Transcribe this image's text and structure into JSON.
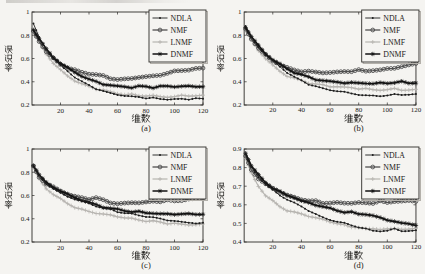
{
  "page": {
    "background": "#f5f4f1"
  },
  "figure": {
    "xlabel": "维数",
    "ylabel": "误识率",
    "legend_labels": [
      "NDLA",
      "NMF",
      "LNMF",
      "DNMF"
    ],
    "styles": {
      "NDLA": {
        "color": "#1c1c1c",
        "marker": "dot",
        "width": 0.9
      },
      "NMF": {
        "color": "#4f4f4f",
        "marker": "circle",
        "width": 1.3
      },
      "LNMF": {
        "color": "#b6b4b0",
        "marker": "plus",
        "width": 1.2
      },
      "DNMF": {
        "color": "#121212",
        "marker": "star",
        "width": 1.5
      }
    },
    "axis_color": "#2e2c29",
    "text_color": "#1c1a18"
  },
  "chart_data": [
    {
      "type": "line",
      "label": "(a)",
      "xlabel": "维数",
      "ylabel": "误识率",
      "xlim": [
        0,
        120
      ],
      "ylim": [
        0.2,
        1.0
      ],
      "xticks": [
        20,
        40,
        60,
        80,
        100,
        120
      ],
      "yticks": [
        0.2,
        0.4,
        0.6,
        0.8,
        1
      ],
      "x": [
        1,
        5,
        10,
        15,
        20,
        25,
        30,
        35,
        40,
        45,
        50,
        55,
        60,
        65,
        70,
        75,
        80,
        85,
        90,
        95,
        100,
        105,
        110,
        115,
        120
      ],
      "series": [
        {
          "name": "NDLA",
          "values": [
            0.9,
            0.78,
            0.68,
            0.6,
            0.54,
            0.49,
            0.44,
            0.4,
            0.37,
            0.34,
            0.32,
            0.3,
            0.29,
            0.28,
            0.27,
            0.27,
            0.26,
            0.26,
            0.25,
            0.25,
            0.25,
            0.25,
            0.25,
            0.26,
            0.25
          ]
        },
        {
          "name": "NMF",
          "values": [
            0.83,
            0.75,
            0.66,
            0.6,
            0.55,
            0.52,
            0.5,
            0.48,
            0.47,
            0.46,
            0.45,
            0.43,
            0.42,
            0.42,
            0.43,
            0.44,
            0.44,
            0.45,
            0.46,
            0.47,
            0.49,
            0.5,
            0.5,
            0.51,
            0.52
          ]
        },
        {
          "name": "LNMF",
          "values": [
            0.82,
            0.74,
            0.64,
            0.56,
            0.5,
            0.45,
            0.41,
            0.38,
            0.36,
            0.34,
            0.33,
            0.31,
            0.3,
            0.29,
            0.29,
            0.28,
            0.28,
            0.28,
            0.27,
            0.27,
            0.27,
            0.28,
            0.28,
            0.28,
            0.28
          ]
        },
        {
          "name": "DNMF",
          "values": [
            0.85,
            0.77,
            0.68,
            0.61,
            0.56,
            0.52,
            0.48,
            0.45,
            0.42,
            0.4,
            0.38,
            0.37,
            0.36,
            0.36,
            0.35,
            0.36,
            0.36,
            0.35,
            0.36,
            0.36,
            0.36,
            0.36,
            0.36,
            0.36,
            0.36
          ]
        }
      ]
    },
    {
      "type": "line",
      "label": "(b)",
      "xlabel": "维数",
      "ylabel": "误识率",
      "xlim": [
        0,
        120
      ],
      "ylim": [
        0.2,
        1.0
      ],
      "xticks": [
        20,
        40,
        60,
        80,
        100,
        120
      ],
      "yticks": [
        0.2,
        0.4,
        0.6,
        0.8,
        1
      ],
      "x": [
        1,
        5,
        10,
        15,
        20,
        25,
        30,
        35,
        40,
        45,
        50,
        55,
        60,
        65,
        70,
        75,
        80,
        85,
        90,
        95,
        100,
        105,
        110,
        115,
        120
      ],
      "series": [
        {
          "name": "NDLA",
          "values": [
            0.88,
            0.78,
            0.7,
            0.63,
            0.58,
            0.53,
            0.48,
            0.44,
            0.41,
            0.38,
            0.36,
            0.34,
            0.33,
            0.32,
            0.31,
            0.3,
            0.29,
            0.28,
            0.28,
            0.28,
            0.28,
            0.29,
            0.29,
            0.29,
            0.29
          ]
        },
        {
          "name": "NMF",
          "values": [
            0.85,
            0.77,
            0.69,
            0.63,
            0.58,
            0.55,
            0.52,
            0.5,
            0.49,
            0.49,
            0.48,
            0.48,
            0.48,
            0.48,
            0.49,
            0.49,
            0.5,
            0.49,
            0.5,
            0.5,
            0.51,
            0.52,
            0.53,
            0.54,
            0.56
          ]
        },
        {
          "name": "LNMF",
          "values": [
            0.84,
            0.76,
            0.67,
            0.6,
            0.54,
            0.49,
            0.45,
            0.43,
            0.41,
            0.39,
            0.38,
            0.37,
            0.36,
            0.36,
            0.35,
            0.35,
            0.34,
            0.34,
            0.33,
            0.33,
            0.33,
            0.34,
            0.33,
            0.33,
            0.33
          ]
        },
        {
          "name": "DNMF",
          "values": [
            0.87,
            0.79,
            0.71,
            0.64,
            0.59,
            0.55,
            0.51,
            0.48,
            0.46,
            0.44,
            0.42,
            0.41,
            0.4,
            0.4,
            0.39,
            0.39,
            0.39,
            0.39,
            0.38,
            0.39,
            0.39,
            0.39,
            0.4,
            0.39,
            0.39
          ]
        }
      ]
    },
    {
      "type": "line",
      "label": "(c)",
      "xlabel": "维数",
      "ylabel": "误识率",
      "xlim": [
        0,
        120
      ],
      "ylim": [
        0.2,
        1.0
      ],
      "xticks": [
        20,
        40,
        60,
        80,
        100,
        120
      ],
      "yticks": [
        0.2,
        0.4,
        0.6,
        0.8,
        1
      ],
      "x": [
        1,
        5,
        10,
        15,
        20,
        25,
        30,
        35,
        40,
        45,
        50,
        55,
        60,
        65,
        70,
        75,
        80,
        85,
        90,
        95,
        100,
        105,
        110,
        115,
        120
      ],
      "series": [
        {
          "name": "NDLA",
          "values": [
            0.86,
            0.77,
            0.7,
            0.66,
            0.62,
            0.59,
            0.57,
            0.55,
            0.53,
            0.51,
            0.49,
            0.48,
            0.46,
            0.45,
            0.44,
            0.43,
            0.42,
            0.41,
            0.4,
            0.39,
            0.38,
            0.37,
            0.37,
            0.36,
            0.36
          ]
        },
        {
          "name": "NMF",
          "values": [
            0.85,
            0.76,
            0.7,
            0.67,
            0.64,
            0.61,
            0.59,
            0.58,
            0.57,
            0.58,
            0.56,
            0.54,
            0.53,
            0.53,
            0.54,
            0.54,
            0.54,
            0.55,
            0.55,
            0.56,
            0.55,
            0.56,
            0.57,
            0.57,
            0.58
          ]
        },
        {
          "name": "LNMF",
          "values": [
            0.84,
            0.74,
            0.66,
            0.61,
            0.57,
            0.53,
            0.5,
            0.48,
            0.46,
            0.45,
            0.44,
            0.43,
            0.42,
            0.41,
            0.4,
            0.39,
            0.38,
            0.38,
            0.37,
            0.36,
            0.36,
            0.35,
            0.35,
            0.35,
            0.35
          ]
        },
        {
          "name": "DNMF",
          "values": [
            0.86,
            0.78,
            0.71,
            0.67,
            0.64,
            0.61,
            0.58,
            0.56,
            0.54,
            0.52,
            0.5,
            0.49,
            0.48,
            0.47,
            0.46,
            0.46,
            0.45,
            0.45,
            0.44,
            0.44,
            0.44,
            0.44,
            0.44,
            0.44,
            0.44
          ]
        }
      ]
    },
    {
      "type": "line",
      "label": "(d)",
      "xlabel": "维数",
      "ylabel": "误识率",
      "xlim": [
        0,
        120
      ],
      "ylim": [
        0.4,
        0.9
      ],
      "xticks": [
        20,
        40,
        60,
        80,
        100,
        120
      ],
      "yticks": [
        0.4,
        0.5,
        0.6,
        0.7,
        0.8,
        0.9
      ],
      "x": [
        1,
        5,
        10,
        15,
        20,
        25,
        30,
        35,
        40,
        45,
        50,
        55,
        60,
        65,
        70,
        75,
        80,
        85,
        90,
        95,
        100,
        105,
        110,
        115,
        120
      ],
      "series": [
        {
          "name": "NDLA",
          "values": [
            0.87,
            0.8,
            0.75,
            0.71,
            0.68,
            0.65,
            0.63,
            0.61,
            0.59,
            0.57,
            0.55,
            0.53,
            0.52,
            0.51,
            0.5,
            0.49,
            0.48,
            0.47,
            0.46,
            0.46,
            0.46,
            0.47,
            0.46,
            0.46,
            0.46
          ]
        },
        {
          "name": "NMF",
          "values": [
            0.86,
            0.79,
            0.74,
            0.71,
            0.69,
            0.67,
            0.65,
            0.64,
            0.63,
            0.62,
            0.62,
            0.61,
            0.61,
            0.61,
            0.61,
            0.61,
            0.61,
            0.61,
            0.61,
            0.62,
            0.61,
            0.62,
            0.62,
            0.62,
            0.62
          ]
        },
        {
          "name": "LNMF",
          "values": [
            0.85,
            0.77,
            0.7,
            0.65,
            0.62,
            0.59,
            0.57,
            0.56,
            0.55,
            0.54,
            0.53,
            0.52,
            0.51,
            0.5,
            0.49,
            0.48,
            0.48,
            0.47,
            0.47,
            0.47,
            0.47,
            0.47,
            0.47,
            0.47,
            0.47
          ]
        },
        {
          "name": "DNMF",
          "values": [
            0.88,
            0.81,
            0.76,
            0.72,
            0.69,
            0.67,
            0.65,
            0.64,
            0.62,
            0.61,
            0.6,
            0.59,
            0.58,
            0.57,
            0.56,
            0.56,
            0.55,
            0.55,
            0.54,
            0.53,
            0.52,
            0.51,
            0.5,
            0.5,
            0.49
          ]
        }
      ]
    }
  ]
}
